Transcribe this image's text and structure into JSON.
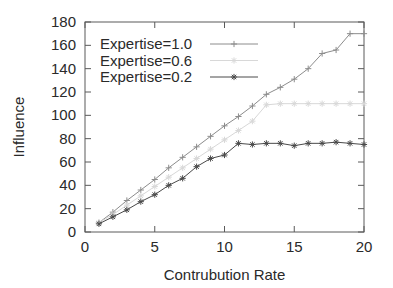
{
  "chart_data": {
    "type": "line",
    "title": "",
    "xlabel": "Contrubution Rate",
    "ylabel": "Influence",
    "xlim": [
      0,
      20
    ],
    "ylim": [
      0,
      180
    ],
    "xticks": [
      "0",
      "5",
      "10",
      "15",
      "20"
    ],
    "xtick_values": [
      0,
      5,
      10,
      15,
      20
    ],
    "yticks": [
      "0",
      "20",
      "40",
      "60",
      "80",
      "100",
      "120",
      "140",
      "160",
      "180"
    ],
    "ytick_values": [
      0,
      20,
      40,
      60,
      80,
      100,
      120,
      140,
      160,
      180
    ],
    "grid": false,
    "legend_position": "top-left-inside",
    "x": [
      1,
      2,
      3,
      4,
      5,
      6,
      7,
      8,
      9,
      10,
      11,
      12,
      13,
      14,
      15,
      16,
      17,
      18,
      19,
      20
    ],
    "series": [
      {
        "name": "Expertise=1.0",
        "color": "#8c8c8c",
        "marker": "plus",
        "values": [
          8,
          17,
          27,
          36,
          45,
          55,
          64,
          73,
          82,
          91,
          99,
          108,
          118,
          124,
          131,
          140,
          153,
          156,
          170,
          170
        ]
      },
      {
        "name": "Expertise=0.6",
        "color": "#d8d8d8",
        "marker": "star",
        "values": [
          8,
          15,
          23,
          31,
          39,
          47,
          55,
          63,
          71,
          79,
          87,
          95,
          109,
          110,
          110,
          110,
          110,
          110,
          110,
          110
        ]
      },
      {
        "name": "Expertise=0.2",
        "color": "#4a4a4a",
        "marker": "star",
        "values": [
          7,
          13,
          19,
          26,
          32,
          40,
          46,
          56,
          63,
          66,
          76,
          75,
          76,
          76,
          74,
          76,
          76,
          77,
          76,
          75
        ]
      }
    ]
  },
  "legend": {
    "entries": [
      {
        "label": "Expertise=1.0"
      },
      {
        "label": "Expertise=0.6"
      },
      {
        "label": "Expertise=0.2"
      }
    ]
  },
  "axes": {
    "x_title": "Contrubution Rate",
    "y_title": "Influence"
  }
}
